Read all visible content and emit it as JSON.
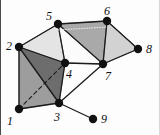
{
  "figure": {
    "background_color": "#fdfdfd",
    "width": 160,
    "height": 135
  },
  "style": {
    "node_color": "#111111",
    "node_radius": 4.2,
    "edge_color": "#1b1b1b",
    "edge_width": 1.3,
    "face_stroke": "#5a5a5a",
    "label_color": "#111111",
    "label_font_size": 12,
    "shade_very_light": "#e2e2e2",
    "shade_light": "#cfcfcf",
    "shade_medium": "#a9a9a9",
    "shade_dark": "#8a8a8a",
    "shade_darker": "#6f6f6f"
  },
  "vertices": [
    {
      "id": "1",
      "label": "1",
      "x": 19,
      "y": 109,
      "label_x": 7,
      "label_y": 115
    },
    {
      "id": "2",
      "label": "2",
      "x": 19,
      "y": 47,
      "label_x": 6,
      "label_y": 40
    },
    {
      "id": "3",
      "label": "3",
      "x": 59,
      "y": 103,
      "label_x": 54,
      "label_y": 111
    },
    {
      "id": "4",
      "label": "4",
      "x": 65,
      "y": 63,
      "label_x": 66,
      "label_y": 68
    },
    {
      "id": "5",
      "label": "5",
      "x": 58,
      "y": 24,
      "label_x": 46,
      "label_y": 10
    },
    {
      "id": "6",
      "label": "6",
      "x": 107,
      "y": 21,
      "label_x": 104,
      "label_y": 5
    },
    {
      "id": "7",
      "label": "7",
      "x": 103,
      "y": 64,
      "label_x": 105,
      "label_y": 70
    },
    {
      "id": "8",
      "label": "8",
      "x": 138,
      "y": 49,
      "label_x": 146,
      "label_y": 43
    },
    {
      "id": "9",
      "label": "9",
      "x": 93,
      "y": 119,
      "label_x": 101,
      "label_y": 113
    }
  ],
  "faces": [
    {
      "id": "face-2-5-4",
      "vertices": [
        "2",
        "5",
        "4"
      ],
      "fill": "#e4e4e4"
    },
    {
      "id": "face-5-6-7",
      "vertices": [
        "5",
        "6",
        "7"
      ],
      "fill": "#a9a9a9"
    },
    {
      "id": "face-6-7-8",
      "vertices": [
        "6",
        "7",
        "8"
      ],
      "fill": "#d2d2d2"
    },
    {
      "id": "face-1-2-3",
      "vertices": [
        "1",
        "2",
        "3"
      ],
      "fill": "#9d9d9d"
    },
    {
      "id": "face-2-4-3",
      "vertices": [
        "2",
        "4",
        "3"
      ],
      "fill": "#6d6d6d"
    },
    {
      "id": "face-5-4-7",
      "vertices": [
        "5",
        "4",
        "7"
      ],
      "fill": "#fbfbfb"
    }
  ],
  "edges": [
    {
      "id": "edge-2-5",
      "from": "2",
      "to": "5",
      "style": "solid"
    },
    {
      "id": "edge-5-4",
      "from": "5",
      "to": "4",
      "style": "solid"
    },
    {
      "id": "edge-2-4",
      "from": "2",
      "to": "4",
      "style": "solid"
    },
    {
      "id": "edge-5-6",
      "from": "5",
      "to": "6",
      "style": "solid"
    },
    {
      "id": "edge-5-7",
      "from": "5",
      "to": "7",
      "style": "solid"
    },
    {
      "id": "edge-6-7",
      "from": "6",
      "to": "7",
      "style": "solid"
    },
    {
      "id": "edge-6-8",
      "from": "6",
      "to": "8",
      "style": "solid"
    },
    {
      "id": "edge-7-8",
      "from": "7",
      "to": "8",
      "style": "solid"
    },
    {
      "id": "edge-4-7",
      "from": "4",
      "to": "7",
      "style": "solid"
    },
    {
      "id": "edge-1-2",
      "from": "1",
      "to": "2",
      "style": "solid"
    },
    {
      "id": "edge-2-3",
      "from": "2",
      "to": "3",
      "style": "solid"
    },
    {
      "id": "edge-1-3",
      "from": "1",
      "to": "3",
      "style": "solid"
    },
    {
      "id": "edge-3-4",
      "from": "3",
      "to": "4",
      "style": "solid"
    },
    {
      "id": "edge-3-7",
      "from": "3",
      "to": "7",
      "style": "solid"
    },
    {
      "id": "edge-3-9",
      "from": "3",
      "to": "9",
      "style": "solid"
    },
    {
      "id": "edge-1-4",
      "from": "1",
      "to": "4",
      "style": "dashed"
    },
    {
      "id": "edge-5-6-hidden",
      "from": "5",
      "to": "6",
      "style": "dotted",
      "offset_y": 6
    }
  ]
}
